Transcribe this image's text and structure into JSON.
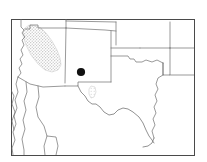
{
  "figure": {
    "kind": "species-distribution-map",
    "region_label": "Southwestern United States and northern Mexico",
    "frame": {
      "x": 11,
      "y": 19,
      "width": 183,
      "height": 136,
      "stroke_color": "#4a4a4a"
    },
    "background_color": "#ffffff",
    "boundary_color": "#6e6e6e"
  },
  "legend_items": [
    {
      "id": "shaded-range",
      "label": "Shaded range",
      "symbol": "stippled-polygon",
      "color": "#d9d9d9"
    },
    {
      "id": "point-locality",
      "label": "Point locality",
      "symbol": "filled-circle",
      "color": "#111111"
    }
  ],
  "shaded_ranges": [
    {
      "id": "arizona-range",
      "name": "Arizona shaded range",
      "fill_color": "#d9d9d9",
      "path": "M 36 26 L 41 28 L 46 33 L 52 41 L 57 50 L 60 58 L 61 65 L 58 70 L 52 72 L 45 70 L 38 64 L 31 55 L 26 45 L 23 36 L 24 29 L 29 25 Z"
    },
    {
      "id": "bigbend-patch",
      "name": "Big Bend shaded patch",
      "fill_color": "#dedede",
      "path": "M 91 86 L 95 87 L 96 92 L 94 97 L 91 98 L 89 94 L 89 89 Z"
    }
  ],
  "point_localities": [
    {
      "id": "locality-1",
      "name": "New Mexico point locality",
      "x": 81,
      "y": 72,
      "radius": 4.1,
      "color": "#111111"
    }
  ],
  "boundary_paths": [
    {
      "id": "utah-nevada-west",
      "name": "Nevada and Utah western boundary",
      "d": "M 21 19 L 21 27 L 24 30 L 22 33 L 25 37 L 22 40 L 24 45 L 21 50 L 23 55 L 20 59 L 22 64 L 19 68 L 21 73 L 18 77"
    },
    {
      "id": "utah-arizona-line",
      "name": "Utah Arizona boundary",
      "d": "M 25 29 L 30 29 L 30 25 L 38 25 L 38 28 L 66 28"
    },
    {
      "id": "utah-colorado-line",
      "name": "Utah Colorado boundary",
      "d": "M 66 19 L 66 28"
    },
    {
      "id": "colorado-north",
      "name": "Colorado northern boundary",
      "d": "M 66 21 L 116 22"
    },
    {
      "id": "colorado-kansas-east",
      "name": "Colorado eastern boundary",
      "d": "M 116 22 L 116 45"
    },
    {
      "id": "colorado-newmexico-line",
      "name": "Colorado New Mexico boundary",
      "d": "M 66 28 L 105 30 L 116 31"
    },
    {
      "id": "arizona-newmexico-line",
      "name": "Arizona New Mexico boundary",
      "d": "M 66 28 L 65 83"
    },
    {
      "id": "arizona-mexico-border",
      "name": "Arizona southern international border",
      "d": "M 18 77 L 30 84 L 43 87 L 65 86"
    },
    {
      "id": "newmexico-south",
      "name": "New Mexico southern boundary",
      "d": "M 65 86 L 78 86 L 78 82 L 111 82"
    },
    {
      "id": "newmexico-texas-east",
      "name": "New Mexico Texas boundary",
      "d": "M 111 31 L 111 82"
    },
    {
      "id": "oklahoma-panhandle-north",
      "name": "Oklahoma panhandle northern line",
      "d": "M 111 48 L 140 48"
    },
    {
      "id": "oklahoma-panhandle-south",
      "name": "Oklahoma panhandle southern line",
      "d": "M 111 56 L 128 56 L 130 59 L 134 59 L 136 62 L 142 62 L 146 60 L 152 62 L 157 60 L 163 63"
    },
    {
      "id": "kansas-oklahoma-line",
      "name": "Kansas Oklahoma boundary",
      "d": "M 140 48 L 170 48"
    },
    {
      "id": "kansas-missouri-east",
      "name": "Kansas eastern boundary",
      "d": "M 170 22 L 170 48"
    },
    {
      "id": "missouri-arkansas-line",
      "name": "Missouri Arkansas boundary",
      "d": "M 170 48 L 194 48"
    },
    {
      "id": "arkansas-louisiana-line",
      "name": "Arkansas Louisiana boundary",
      "d": "M 170 75 L 194 75"
    },
    {
      "id": "arkansas-west",
      "name": "Arkansas western boundary",
      "d": "M 170 48 L 170 75 L 163 75 L 163 63"
    },
    {
      "id": "texas-oklahoma-redriver",
      "name": "Texas Oklahoma Red River boundary",
      "d": "M 163 63 L 163 75"
    },
    {
      "id": "texas-louisiana-east",
      "name": "Texas Louisiana eastern boundary",
      "d": "M 163 75 L 158 78 L 156 84 L 158 89 L 155 95 L 157 101 L 154 107 L 156 113 L 153 119 L 155 125 L 152 131 L 154 138"
    },
    {
      "id": "mexico-chihuahua-west",
      "name": "Mexico Sonora western coast",
      "d": "M 18 77 L 16 84 L 18 92 L 15 100 L 17 108 L 14 116 L 16 124 L 13 132 L 15 140 L 12 148 L 13 155"
    },
    {
      "id": "mexico-sonora-chihuahua",
      "name": "Sonora Chihuahua boundary",
      "d": "M 26 82 L 27 92 L 24 101 L 26 110 L 23 120 L 25 129 L 22 139 L 24 150 L 24 155"
    },
    {
      "id": "mexico-chihuahua-east",
      "name": "Chihuahua Coahuila boundary",
      "d": "M 38 86 L 39 97 L 36 107 L 38 117 L 44 126 L 47 136 L 44 146 L 45 155"
    },
    {
      "id": "mexico-durango-line",
      "name": "Durango boundary",
      "d": "M 47 136 L 56 137 L 58 146 L 56 155"
    },
    {
      "id": "baja-peninsula",
      "name": "Baja California peninsula",
      "d": "M 11 90 L 14 96 L 12 104 L 15 112 L 12 121 L 14 130"
    }
  ],
  "coastline_paths": [
    {
      "id": "rio-grande",
      "name": "Rio Grande international boundary",
      "d": "M 78 86 L 81 92 L 85 96 L 88 101 L 92 104 L 96 104 L 100 107 L 104 112 L 109 115 L 114 114 L 118 110 L 123 108 L 128 109 L 133 112 L 139 117 L 143 123 L 146 130 L 149 136 L 152 140 L 154 143"
    },
    {
      "id": "gulf-coast",
      "name": "Texas Gulf coastline",
      "d": "M 154 138 L 152 143 L 148 146 L 143 147"
    }
  ]
}
